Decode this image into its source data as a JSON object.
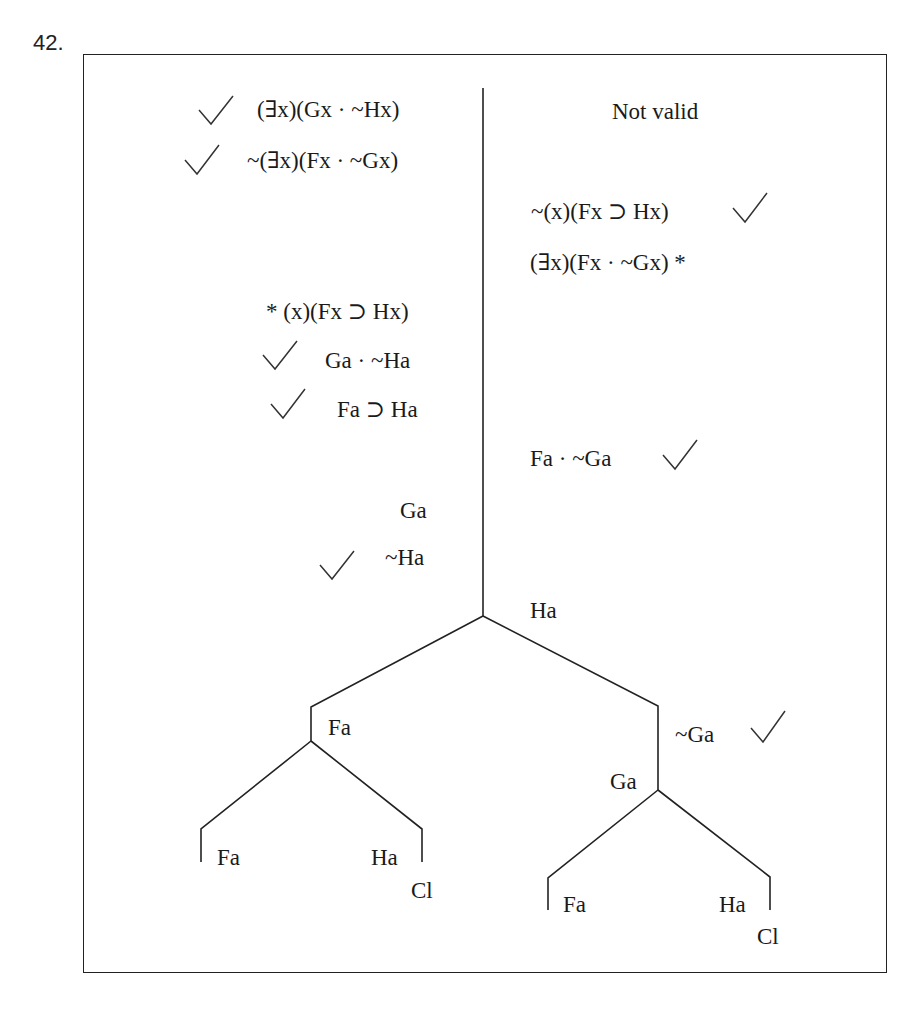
{
  "problem_number": "42.",
  "verdict": "Not valid",
  "check_mark": "✓",
  "left_column": [
    {
      "text": "(∃x)(Gx · ~Hx)",
      "checked": true
    },
    {
      "text": "~(∃x)(Fx · ~Gx)",
      "checked": true
    },
    {
      "text": "* (x)(Fx ⊃ Hx)",
      "checked": false
    },
    {
      "text": "Ga · ~Ha",
      "checked": true
    },
    {
      "text": "Fa ⊃ Ha",
      "checked": true
    },
    {
      "text": "Ga",
      "checked": false
    },
    {
      "text": "~Ha",
      "checked": true
    }
  ],
  "right_column": [
    {
      "text": "~(x)(Fx ⊃ Hx)",
      "checked": true
    },
    {
      "text": "(∃x)(Fx · ~Gx) *",
      "checked": false
    },
    {
      "text": "Fa · ~Ga",
      "checked": true
    },
    {
      "text": "Ha",
      "checked": false
    }
  ],
  "tree": {
    "left_branch": {
      "node": "Fa",
      "leaves": [
        {
          "text": "Fa",
          "closed": false
        },
        {
          "text": "Ha",
          "closed": true,
          "closed_label": "Cl"
        }
      ]
    },
    "right_branch": {
      "nodes": [
        {
          "text": "~Ga",
          "checked": true
        },
        {
          "text": "Ga"
        }
      ],
      "leaves": [
        {
          "text": "Fa",
          "closed": false
        },
        {
          "text": "Ha",
          "closed": true,
          "closed_label": "Cl"
        }
      ]
    }
  }
}
